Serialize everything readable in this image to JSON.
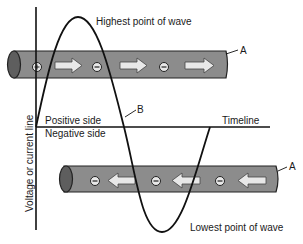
{
  "diagram": {
    "labels": {
      "highest": "Highest point of wave",
      "lowest": "Lowest point of wave",
      "positive": "Positive side",
      "negative": "Negative side",
      "timeline": "Timeline",
      "axis": "Voltage or current line",
      "a_top": "A",
      "a_bottom": "A",
      "b": "B"
    },
    "top_conductor": {
      "flow_direction": "right",
      "charges": [
        "+",
        "-",
        "-"
      ]
    },
    "bottom_conductor": {
      "flow_direction": "left",
      "charges": [
        "-",
        "-",
        "-"
      ]
    },
    "colors": {
      "conductor_fill": "#8c8c8c",
      "conductor_end": "#5e5e5e",
      "arrow_fill": "#e8e8e8",
      "line": "#111111"
    }
  }
}
